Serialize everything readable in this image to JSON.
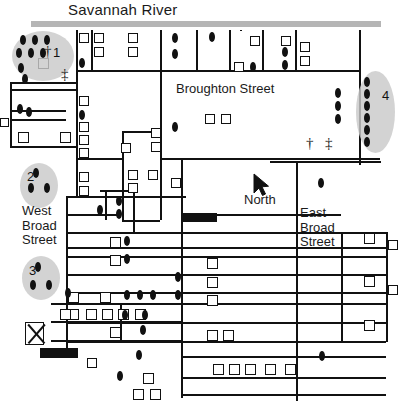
{
  "map": {
    "title": "Savannah Historic District Map",
    "river_label": "Savannah River",
    "broughton_label": "Broughton Street",
    "west_broad_label": "West\nBroad\nStreet",
    "east_broad_label": "East\nBroad\nStreet",
    "north_label": "North",
    "colors": {
      "line": "#111111",
      "river": "#b5b5b5",
      "zone_fill": "#c9c9c9",
      "background": "#ffffff",
      "text": "#1a1a1a"
    }
  },
  "zones": [
    {
      "id": "zone-1",
      "number": "1",
      "x": 12,
      "y": 31,
      "w": 62,
      "h": 50,
      "num_x": 53,
      "num_y": 45,
      "dots": 8
    },
    {
      "id": "zone-2",
      "number": "2",
      "x": 20,
      "y": 163,
      "w": 38,
      "h": 45,
      "num_x": 27,
      "num_y": 169,
      "dots": 3
    },
    {
      "id": "zone-3",
      "number": "3",
      "x": 22,
      "y": 256,
      "w": 38,
      "h": 44,
      "num_x": 29,
      "num_y": 263,
      "dots": 3
    },
    {
      "id": "zone-4",
      "number": "4",
      "x": 356,
      "y": 71,
      "w": 39,
      "h": 82,
      "num_x": 382,
      "num_y": 88,
      "dots": 6
    }
  ],
  "symbols": [
    {
      "name": "church-dagger-zone1",
      "glyph": "†",
      "x": 44,
      "y": 44
    },
    {
      "name": "church-double-dagger-zone1",
      "glyph": "‡",
      "x": 61,
      "y": 67
    },
    {
      "name": "church-dagger-east",
      "glyph": "†",
      "x": 306,
      "y": 136
    },
    {
      "name": "church-double-dagger-east",
      "glyph": "‡",
      "x": 325,
      "y": 136
    }
  ],
  "hlines": [
    {
      "x": 31,
      "y": 27,
      "w": 350,
      "t": "river"
    },
    {
      "x": 10,
      "y": 82,
      "w": 66
    },
    {
      "x": 10,
      "y": 89,
      "w": 66
    },
    {
      "x": 10,
      "y": 110,
      "w": 56
    },
    {
      "x": 10,
      "y": 119,
      "w": 56
    },
    {
      "x": 10,
      "y": 146,
      "w": 66
    },
    {
      "x": 76,
      "y": 70,
      "w": 283
    },
    {
      "x": 160,
      "y": 158,
      "w": 220
    },
    {
      "x": 76,
      "y": 158,
      "w": 46
    },
    {
      "x": 122,
      "y": 131,
      "w": 40
    },
    {
      "x": 270,
      "y": 161,
      "w": 111
    },
    {
      "x": 66,
      "y": 196,
      "w": 120
    },
    {
      "x": 100,
      "y": 190,
      "w": 28
    },
    {
      "x": 66,
      "y": 214,
      "w": 53
    },
    {
      "x": 66,
      "y": 232,
      "w": 320
    },
    {
      "x": 66,
      "y": 247,
      "w": 320
    },
    {
      "x": 66,
      "y": 256,
      "w": 320
    },
    {
      "x": 66,
      "y": 274,
      "w": 320
    },
    {
      "x": 66,
      "y": 292,
      "w": 320
    },
    {
      "x": 66,
      "y": 303,
      "w": 320
    },
    {
      "x": 51,
      "y": 303,
      "w": 20
    },
    {
      "x": 51,
      "y": 321,
      "w": 130
    },
    {
      "x": 51,
      "y": 340,
      "w": 130
    },
    {
      "x": 66,
      "y": 322,
      "w": 320
    },
    {
      "x": 66,
      "y": 341,
      "w": 320
    },
    {
      "x": 181,
      "y": 356,
      "w": 205
    },
    {
      "x": 181,
      "y": 377,
      "w": 205
    },
    {
      "x": 181,
      "y": 394,
      "w": 205
    },
    {
      "x": 122,
      "y": 220,
      "w": 38
    },
    {
      "x": 181,
      "y": 214,
      "w": 160
    }
  ],
  "vlines": [
    {
      "x": 10,
      "y": 82,
      "w": 1,
      "h": 65
    },
    {
      "x": 76,
      "y": 30,
      "h": 166
    },
    {
      "x": 91,
      "y": 30,
      "h": 40
    },
    {
      "x": 122,
      "y": 131,
      "h": 90
    },
    {
      "x": 160,
      "y": 30,
      "h": 128
    },
    {
      "x": 181,
      "y": 158,
      "h": 240
    },
    {
      "x": 196,
      "y": 30,
      "h": 40
    },
    {
      "x": 229,
      "y": 30,
      "h": 40
    },
    {
      "x": 262,
      "y": 30,
      "h": 40
    },
    {
      "x": 295,
      "y": 30,
      "h": 40
    },
    {
      "x": 359,
      "y": 30,
      "h": 40
    },
    {
      "x": 359,
      "y": 70,
      "h": 95
    },
    {
      "x": 296,
      "y": 161,
      "h": 240
    },
    {
      "x": 341,
      "y": 232,
      "h": 110
    },
    {
      "x": 133,
      "y": 190,
      "h": 42
    },
    {
      "x": 105,
      "y": 190,
      "h": 30
    },
    {
      "x": 66,
      "y": 196,
      "h": 160
    },
    {
      "x": 160,
      "y": 158,
      "h": 62
    },
    {
      "x": 386,
      "y": 232,
      "h": 110
    },
    {
      "x": 120,
      "y": 303,
      "h": 40
    },
    {
      "x": 240,
      "y": 30,
      "h": 1
    }
  ],
  "buildings": [
    {
      "x": 79,
      "y": 33,
      "w": 10,
      "h": 10
    },
    {
      "x": 94,
      "y": 33,
      "w": 10,
      "h": 10
    },
    {
      "x": 94,
      "y": 47,
      "w": 10,
      "h": 10
    },
    {
      "x": 128,
      "y": 33,
      "w": 10,
      "h": 10
    },
    {
      "x": 128,
      "y": 47,
      "w": 10,
      "h": 10
    },
    {
      "x": 38,
      "y": 58,
      "w": 11,
      "h": 11
    },
    {
      "x": 250,
      "y": 36,
      "w": 10,
      "h": 10
    },
    {
      "x": 281,
      "y": 36,
      "w": 10,
      "h": 10
    },
    {
      "x": 300,
      "y": 42,
      "w": 10,
      "h": 10
    },
    {
      "x": 300,
      "y": 56,
      "w": 10,
      "h": 10
    },
    {
      "x": 234,
      "y": 62,
      "w": 10,
      "h": 10
    },
    {
      "x": 18,
      "y": 132,
      "w": 11,
      "h": 11
    },
    {
      "x": 60,
      "y": 132,
      "w": 11,
      "h": 11
    },
    {
      "x": 79,
      "y": 96,
      "w": 10,
      "h": 10
    },
    {
      "x": 79,
      "y": 122,
      "w": 10,
      "h": 10
    },
    {
      "x": 79,
      "y": 135,
      "w": 10,
      "h": 10
    },
    {
      "x": 79,
      "y": 148,
      "w": 10,
      "h": 10
    },
    {
      "x": 0,
      "y": 118,
      "w": 9,
      "h": 9
    },
    {
      "x": 121,
      "y": 143,
      "w": 10,
      "h": 10
    },
    {
      "x": 151,
      "y": 128,
      "w": 10,
      "h": 10
    },
    {
      "x": 151,
      "y": 142,
      "w": 10,
      "h": 10
    },
    {
      "x": 128,
      "y": 170,
      "w": 10,
      "h": 10
    },
    {
      "x": 148,
      "y": 170,
      "w": 10,
      "h": 10
    },
    {
      "x": 128,
      "y": 183,
      "w": 10,
      "h": 10
    },
    {
      "x": 171,
      "y": 178,
      "w": 10,
      "h": 10
    },
    {
      "x": 205,
      "y": 114,
      "w": 10,
      "h": 10
    },
    {
      "x": 221,
      "y": 114,
      "w": 10,
      "h": 10
    },
    {
      "x": 79,
      "y": 172,
      "w": 10,
      "h": 10
    },
    {
      "x": 79,
      "y": 186,
      "w": 10,
      "h": 10
    },
    {
      "x": 110,
      "y": 237,
      "w": 11,
      "h": 11
    },
    {
      "x": 110,
      "y": 255,
      "w": 11,
      "h": 11
    },
    {
      "x": 207,
      "y": 258,
      "w": 11,
      "h": 11
    },
    {
      "x": 207,
      "y": 277,
      "w": 11,
      "h": 11
    },
    {
      "x": 207,
      "y": 295,
      "w": 11,
      "h": 11
    },
    {
      "x": 100,
      "y": 292,
      "w": 11,
      "h": 11
    },
    {
      "x": 68,
      "y": 292,
      "w": 11,
      "h": 11
    },
    {
      "x": 68,
      "y": 309,
      "w": 11,
      "h": 11
    },
    {
      "x": 86,
      "y": 309,
      "w": 11,
      "h": 11
    },
    {
      "x": 60,
      "y": 309,
      "w": 11,
      "h": 11
    },
    {
      "x": 102,
      "y": 309,
      "w": 11,
      "h": 11
    },
    {
      "x": 118,
      "y": 309,
      "w": 11,
      "h": 11
    },
    {
      "x": 135,
      "y": 309,
      "w": 11,
      "h": 11
    },
    {
      "x": 110,
      "y": 327,
      "w": 11,
      "h": 11
    },
    {
      "x": 207,
      "y": 330,
      "w": 11,
      "h": 11
    },
    {
      "x": 223,
      "y": 330,
      "w": 11,
      "h": 11
    },
    {
      "x": 87,
      "y": 358,
      "w": 10,
      "h": 10
    },
    {
      "x": 143,
      "y": 373,
      "w": 11,
      "h": 11
    },
    {
      "x": 133,
      "y": 389,
      "w": 11,
      "h": 11
    },
    {
      "x": 150,
      "y": 389,
      "w": 11,
      "h": 11
    },
    {
      "x": 213,
      "y": 364,
      "w": 11,
      "h": 11
    },
    {
      "x": 229,
      "y": 364,
      "w": 11,
      "h": 11
    },
    {
      "x": 245,
      "y": 364,
      "w": 11,
      "h": 11
    },
    {
      "x": 265,
      "y": 364,
      "w": 11,
      "h": 11
    },
    {
      "x": 285,
      "y": 364,
      "w": 11,
      "h": 11
    },
    {
      "x": 364,
      "y": 233,
      "w": 11,
      "h": 11
    },
    {
      "x": 364,
      "y": 276,
      "w": 11,
      "h": 11
    },
    {
      "x": 364,
      "y": 320,
      "w": 11,
      "h": 11
    },
    {
      "x": 388,
      "y": 240,
      "w": 10,
      "h": 10
    },
    {
      "x": 388,
      "y": 285,
      "w": 10,
      "h": 10
    }
  ],
  "solids": [
    {
      "name": "block-structure-center",
      "x": 181,
      "y": 213,
      "w": 36,
      "h": 9
    },
    {
      "name": "block-structure-southwest",
      "x": 40,
      "y": 348,
      "w": 38,
      "h": 10
    }
  ],
  "dots": [
    {
      "x": 20,
      "y": 35
    },
    {
      "x": 32,
      "y": 35
    },
    {
      "x": 44,
      "y": 35
    },
    {
      "x": 16,
      "y": 48
    },
    {
      "x": 28,
      "y": 48
    },
    {
      "x": 40,
      "y": 48
    },
    {
      "x": 18,
      "y": 63
    },
    {
      "x": 22,
      "y": 74
    },
    {
      "x": 79,
      "y": 58
    },
    {
      "x": 17,
      "y": 104
    },
    {
      "x": 26,
      "y": 107
    },
    {
      "x": 172,
      "y": 33
    },
    {
      "x": 172,
      "y": 49
    },
    {
      "x": 209,
      "y": 32
    },
    {
      "x": 250,
      "y": 62
    },
    {
      "x": 282,
      "y": 47
    },
    {
      "x": 282,
      "y": 60
    },
    {
      "x": 335,
      "y": 88
    },
    {
      "x": 335,
      "y": 101
    },
    {
      "x": 335,
      "y": 114
    },
    {
      "x": 364,
      "y": 77
    },
    {
      "x": 364,
      "y": 89
    },
    {
      "x": 364,
      "y": 101
    },
    {
      "x": 364,
      "y": 113
    },
    {
      "x": 364,
      "y": 125
    },
    {
      "x": 364,
      "y": 137
    },
    {
      "x": 172,
      "y": 122
    },
    {
      "x": 79,
      "y": 110
    },
    {
      "x": 33,
      "y": 168
    },
    {
      "x": 28,
      "y": 183
    },
    {
      "x": 44,
      "y": 183
    },
    {
      "x": 35,
      "y": 262
    },
    {
      "x": 30,
      "y": 280
    },
    {
      "x": 46,
      "y": 280
    },
    {
      "x": 116,
      "y": 196
    },
    {
      "x": 116,
      "y": 209
    },
    {
      "x": 97,
      "y": 205
    },
    {
      "x": 318,
      "y": 178
    },
    {
      "x": 124,
      "y": 236
    },
    {
      "x": 124,
      "y": 254
    },
    {
      "x": 65,
      "y": 288
    },
    {
      "x": 124,
      "y": 290
    },
    {
      "x": 137,
      "y": 290
    },
    {
      "x": 150,
      "y": 290
    },
    {
      "x": 175,
      "y": 272
    },
    {
      "x": 175,
      "y": 290
    },
    {
      "x": 122,
      "y": 310
    },
    {
      "x": 142,
      "y": 310
    },
    {
      "x": 140,
      "y": 325
    },
    {
      "x": 117,
      "y": 371
    },
    {
      "x": 136,
      "y": 350
    },
    {
      "x": 319,
      "y": 351
    }
  ]
}
